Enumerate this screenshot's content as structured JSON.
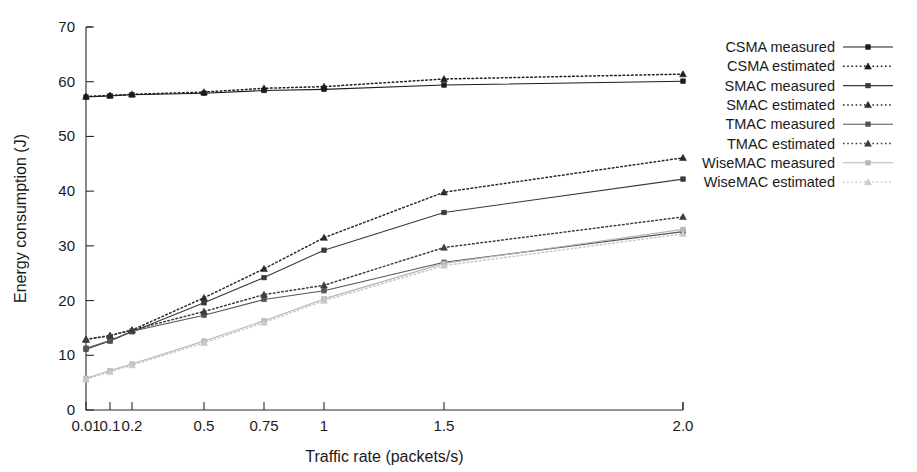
{
  "chart_data": {
    "type": "line",
    "title": "",
    "xlabel": "Traffic rate (packets/s)",
    "ylabel": "Energy consumption  (J)",
    "x": [
      0.01,
      0.1,
      0.2,
      0.5,
      0.75,
      1,
      1.5,
      2.0
    ],
    "xtick_labels": [
      "0.01",
      "0.1",
      "0.2",
      "0.5",
      "0.75",
      "1",
      "1.5",
      "2.0"
    ],
    "ytick_labels": [
      "0",
      "10",
      "20",
      "30",
      "40",
      "50",
      "60",
      "70"
    ],
    "ylim": [
      0,
      70
    ],
    "grid": false,
    "legend_position": "right",
    "series": [
      {
        "name": "CSMA measured",
        "style": "solid",
        "marker": "square",
        "color": "#1c1c1c",
        "values": [
          57.2,
          57.4,
          57.6,
          57.9,
          58.4,
          58.6,
          59.4,
          60.1
        ]
      },
      {
        "name": "CSMA estimated",
        "style": "dotted",
        "marker": "triangle",
        "color": "#1c1c1c",
        "values": [
          57.3,
          57.5,
          57.7,
          58.1,
          58.8,
          59.1,
          60.5,
          61.4
        ]
      },
      {
        "name": "SMAC measured",
        "style": "solid",
        "marker": "square",
        "color": "#3a3a3a",
        "values": [
          11.1,
          12.6,
          14.3,
          19.6,
          24.2,
          29.2,
          36.1,
          42.2
        ]
      },
      {
        "name": "SMAC estimated",
        "style": "dotted",
        "marker": "triangle",
        "color": "#2a2a2a",
        "values": [
          12.9,
          13.6,
          14.6,
          20.5,
          25.8,
          31.5,
          39.8,
          46.1
        ]
      },
      {
        "name": "TMAC measured",
        "style": "solid",
        "marker": "square",
        "color": "#555555",
        "values": [
          11.3,
          12.7,
          14.4,
          17.3,
          20.2,
          21.8,
          27.0,
          32.6
        ]
      },
      {
        "name": "TMAC estimated",
        "style": "dotted",
        "marker": "triangle",
        "color": "#3d3d3d",
        "values": [
          12.9,
          13.6,
          14.6,
          18.0,
          21.1,
          22.8,
          29.7,
          35.3
        ]
      },
      {
        "name": "WiseMAC measured",
        "style": "solid",
        "marker": "square",
        "color": "#b6b6b6",
        "values": [
          5.8,
          7.2,
          8.4,
          12.6,
          16.3,
          20.3,
          26.8,
          33.0
        ]
      },
      {
        "name": "WiseMAC estimated",
        "style": "dotted",
        "marker": "triangle",
        "color": "#c9c9c9",
        "values": [
          5.6,
          7.0,
          8.2,
          12.3,
          16.0,
          20.0,
          26.4,
          32.2
        ]
      }
    ]
  }
}
